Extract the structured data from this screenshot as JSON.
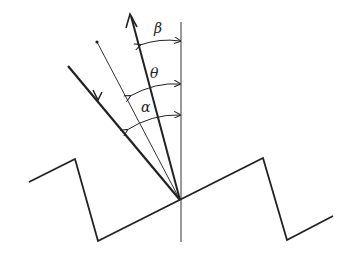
{
  "diagram": {
    "title": "",
    "labels": {
      "beta": "β",
      "theta": "θ",
      "alpha": "α"
    },
    "elements": [
      "sawtooth-grating-surface",
      "grating-normal-line",
      "incident-ray",
      "facet-normal-ray",
      "diffracted-ray"
    ]
  }
}
